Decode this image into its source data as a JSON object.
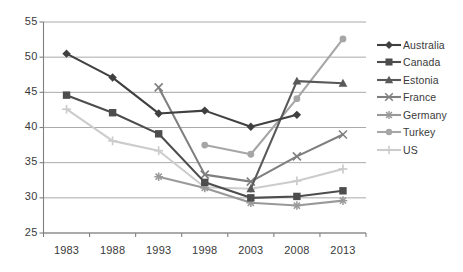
{
  "chart_data": {
    "type": "line",
    "title": "",
    "xlabel": "",
    "ylabel": "",
    "x": [
      1983,
      1988,
      1993,
      1998,
      2003,
      2008,
      2013
    ],
    "xticklabels": [
      "1983",
      "1988",
      "1993",
      "1998",
      "2003",
      "2008",
      "2013"
    ],
    "yticklabels": [
      "25",
      "30",
      "35",
      "40",
      "45",
      "50",
      "55"
    ],
    "yticks": [
      25,
      30,
      35,
      40,
      45,
      50,
      55
    ],
    "ylim": [
      25,
      55
    ],
    "xlim": [
      1980.5,
      2015.5
    ],
    "grid": "horizontal",
    "legend_position": "right",
    "series": [
      {
        "name": "Australia",
        "marker": "diamond",
        "color": "#404040",
        "x": [
          1983,
          1988,
          1993,
          1998,
          2003,
          2008
        ],
        "values": [
          50.5,
          47.1,
          42.0,
          42.4,
          40.1,
          41.8
        ]
      },
      {
        "name": "Canada",
        "marker": "square",
        "color": "#4d4d4d",
        "x": [
          1983,
          1988,
          1993,
          1998,
          2003,
          2008,
          2013
        ],
        "values": [
          44.6,
          42.1,
          39.1,
          32.2,
          30.0,
          30.2,
          31.0
        ]
      },
      {
        "name": "Estonia",
        "marker": "triangle",
        "color": "#595959",
        "x": [
          2003,
          2008,
          2013
        ],
        "values": [
          31.3,
          46.6,
          46.3
        ]
      },
      {
        "name": "France",
        "marker": "x",
        "color": "#7f7f7f",
        "x": [
          1993,
          1998,
          2003,
          2008,
          2013
        ],
        "values": [
          45.7,
          33.3,
          32.3,
          35.9,
          39.0
        ]
      },
      {
        "name": "Germany",
        "marker": "asterisk",
        "color": "#999999",
        "x": [
          1993,
          1998,
          2003,
          2008,
          2013
        ],
        "values": [
          33.0,
          31.4,
          29.3,
          28.9,
          29.6
        ]
      },
      {
        "name": "Turkey",
        "marker": "circle",
        "color": "#a6a6a6",
        "x": [
          1998,
          2003,
          2008,
          2013
        ],
        "values": [
          37.5,
          36.2,
          44.1,
          52.6
        ]
      },
      {
        "name": "US",
        "marker": "plus",
        "color": "#cccccc",
        "x": [
          1983,
          1988,
          1993,
          1998,
          2003,
          2008,
          2013
        ],
        "values": [
          42.6,
          38.1,
          36.7,
          31.5,
          31.3,
          32.4,
          34.1
        ]
      }
    ]
  },
  "legend": {
    "items": [
      {
        "label": "Australia"
      },
      {
        "label": "Canada"
      },
      {
        "label": "Estonia"
      },
      {
        "label": "France"
      },
      {
        "label": "Germany"
      },
      {
        "label": "Turkey"
      },
      {
        "label": "US"
      }
    ]
  },
  "axis": {
    "y_labels": [
      "55",
      "50",
      "45",
      "40",
      "35",
      "30",
      "25"
    ],
    "x_labels": [
      "1983",
      "1988",
      "1993",
      "1998",
      "2003",
      "2008",
      "2013"
    ]
  },
  "colors": {
    "grid": "#a0a0a0",
    "axis": "#808080",
    "text": "#3a3a3a",
    "background": "#ffffff"
  }
}
